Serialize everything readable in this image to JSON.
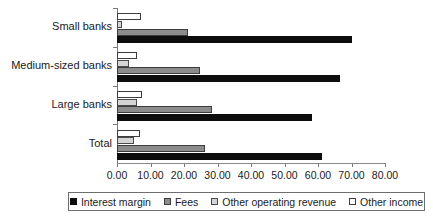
{
  "chart_data": {
    "type": "bar",
    "orientation": "horizontal",
    "title": "",
    "xlabel": "",
    "ylabel": "",
    "xlim": [
      0,
      80
    ],
    "xticks": [
      "0.00",
      "10.00",
      "20.00",
      "30.00",
      "40.00",
      "50.00",
      "60.00",
      "70.00",
      "80.00"
    ],
    "xtick_values": [
      0,
      10,
      20,
      30,
      40,
      50,
      60,
      70,
      80
    ],
    "grid": false,
    "legend_position": "bottom",
    "categories": [
      "Small banks",
      "Medium-sized banks",
      "Large banks",
      "Total"
    ],
    "series": [
      {
        "name": "Interest margin",
        "color": "#0d0d0d",
        "values": [
          70.1,
          66.6,
          58.2,
          61.2
        ]
      },
      {
        "name": "Fees",
        "color": "#8c8c8c",
        "values": [
          21.2,
          24.8,
          28.4,
          26.3
        ]
      },
      {
        "name": "Other operating revenue",
        "color": "#d4d4d4",
        "values": [
          1.5,
          3.7,
          6.0,
          5.0
        ]
      },
      {
        "name": "Other income",
        "color": "#ffffff",
        "values": [
          7.2,
          5.9,
          7.4,
          6.9
        ]
      }
    ]
  },
  "legend": {
    "items": [
      {
        "label": "Interest margin"
      },
      {
        "label": "Fees"
      },
      {
        "label": "Other operating revenue"
      },
      {
        "label": "Other income"
      }
    ]
  }
}
